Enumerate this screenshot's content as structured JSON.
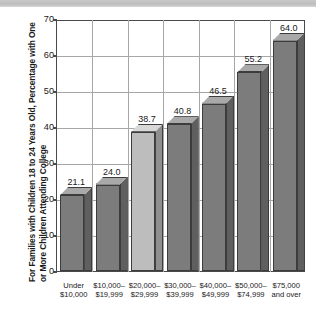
{
  "chart_data": {
    "type": "bar",
    "title": "",
    "xlabel": "",
    "ylabel": "For Families with Children 18 to 24 Years Old, Percentage with One or More Children Attending College",
    "ylim": [
      0,
      70
    ],
    "yticks": [
      0,
      10,
      20,
      30,
      40,
      50,
      60,
      70
    ],
    "grid": true,
    "legend": "none",
    "categories": [
      "Under\n$10,000",
      "$10,000–\n$19,999",
      "$20,000–\n$29,999",
      "$30,000–\n$39,999",
      "$40,000–\n$49,999",
      "$50,000–\n$74,999",
      "$75,000\nand over"
    ],
    "category_lines": [
      [
        "Under",
        "$10,000"
      ],
      [
        "$10,000–",
        "$19,999"
      ],
      [
        "$20,000–",
        "$29,999"
      ],
      [
        "$30,000–",
        "$39,999"
      ],
      [
        "$40,000–",
        "$49,999"
      ],
      [
        "$50,000–",
        "$74,999"
      ],
      [
        "$75,000",
        "and over"
      ]
    ],
    "values": [
      21.1,
      24.0,
      38.7,
      40.8,
      46.5,
      55.2,
      64.0
    ],
    "value_labels": [
      "21.1",
      "24.0",
      "38.7",
      "40.8",
      "46.5",
      "55.2",
      "64.0"
    ],
    "highlight_index": 2,
    "colors": {
      "bar_front": "#7c7c7c",
      "bar_side": "#5f5f5f",
      "bar_top": "#a9a9a9",
      "bar_front_highlight": "#bdbdbd",
      "bar_side_highlight": "#8f8f8f",
      "bar_top_highlight": "#d8d8d8",
      "axis": "#4a4a4a",
      "grid": "#a7a7a7",
      "text": "#1a1a1a",
      "background": "#ffffff"
    }
  },
  "ytick_labels": [
    "70",
    "60",
    "50",
    "40",
    "30",
    "20",
    "10",
    "0"
  ]
}
